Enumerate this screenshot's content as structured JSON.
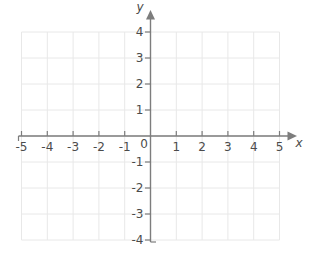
{
  "page": {
    "background": "#ffffff",
    "description_label": "Blank coordinate plane"
  },
  "chart_data": {
    "type": "scatter",
    "title": "",
    "series": [],
    "xlabel": "x",
    "ylabel": "y",
    "origin_label": "0",
    "xlim": [
      -5,
      5
    ],
    "ylim": [
      -4,
      4
    ],
    "xticks": [
      -5,
      -4,
      -3,
      -2,
      -1,
      1,
      2,
      3,
      4,
      5
    ],
    "x_tick_labels": [
      "-5",
      "-4",
      "-3",
      "-2",
      "-1",
      "1",
      "2",
      "3",
      "4",
      "5"
    ],
    "yticks": [
      -4,
      -3,
      -2,
      -1,
      1,
      2,
      3,
      4
    ],
    "y_tick_labels": [
      "-4",
      "-3",
      "-2",
      "-1",
      "1",
      "2",
      "3",
      "4"
    ],
    "grid": true,
    "legend_position": "none",
    "colors": {
      "grid": "#e8e8e8",
      "axis": "#7d7d7d",
      "labels": "#4b4b4b",
      "background": "#ffffff"
    }
  }
}
